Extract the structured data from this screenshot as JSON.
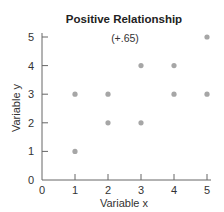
{
  "chart_data": {
    "type": "scatter",
    "title": "Positive Relationship",
    "annotation": "(+.65)",
    "xlabel": "Variable x",
    "ylabel": "Variable y",
    "xlim": [
      0,
      5
    ],
    "ylim": [
      0,
      5
    ],
    "xticks": [
      "0",
      "1",
      "2",
      "3",
      "4",
      "5"
    ],
    "yticks": [
      "0",
      "1",
      "2",
      "3",
      "4",
      "5"
    ],
    "grid": false,
    "point_color": "#a6a6a6",
    "points": [
      {
        "x": 1,
        "y": 3
      },
      {
        "x": 2,
        "y": 3
      },
      {
        "x": 3,
        "y": 4
      },
      {
        "x": 4,
        "y": 4
      },
      {
        "x": 5,
        "y": 5
      },
      {
        "x": 4,
        "y": 3
      },
      {
        "x": 5,
        "y": 3
      },
      {
        "x": 1,
        "y": 1
      },
      {
        "x": 2,
        "y": 2
      },
      {
        "x": 3,
        "y": 2
      }
    ]
  }
}
